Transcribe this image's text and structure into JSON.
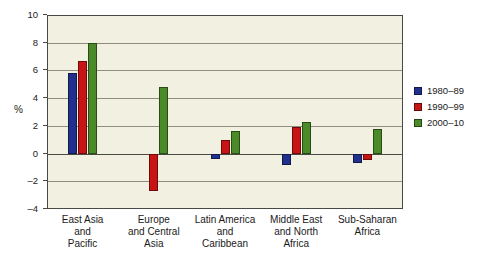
{
  "chart_data": {
    "type": "bar",
    "title": "",
    "subtitle": "",
    "xlabel": "",
    "ylabel": "%",
    "ylim": [
      -4,
      10
    ],
    "yticks": [
      10,
      8,
      6,
      4,
      2,
      0,
      -2,
      -4
    ],
    "ytick_labels": [
      "10",
      "8",
      "6",
      "4",
      "2",
      "0",
      "–2",
      "–4"
    ],
    "grid": true,
    "legend_position": "right",
    "categories": [
      "East Asia\nand\nPacific",
      "Europe\nand Central\nAsia",
      "Latin America\nand\nCaribbean",
      "Middle East\nand North\nAfrica",
      "Sub-Saharan\nAfrica"
    ],
    "series": [
      {
        "name": "1980–89",
        "color": "#20308c",
        "values": [
          5.85,
          null,
          -0.4,
          -0.8,
          -0.7
        ]
      },
      {
        "name": "1990–99",
        "color": "#c81414",
        "values": [
          6.7,
          -2.7,
          1.0,
          1.9,
          -0.5
        ]
      },
      {
        "name": "2000–10",
        "color": "#4a8a28",
        "values": [
          8.0,
          4.8,
          1.6,
          2.25,
          1.8
        ]
      }
    ]
  },
  "colors": {
    "page_background": "#ffffff",
    "plot_background": "#f2f0e0",
    "frame": "#4a4a44",
    "gridline": "#8f8d80",
    "series_1980_89": "#20308c",
    "series_1990_99": "#c81414",
    "series_2000_10": "#4a8a28"
  },
  "legend": {
    "items": [
      {
        "label": "1980–89",
        "color": "#20308c"
      },
      {
        "label": "1990–99",
        "color": "#c81414"
      },
      {
        "label": "2000–10",
        "color": "#4a8a28"
      }
    ]
  }
}
